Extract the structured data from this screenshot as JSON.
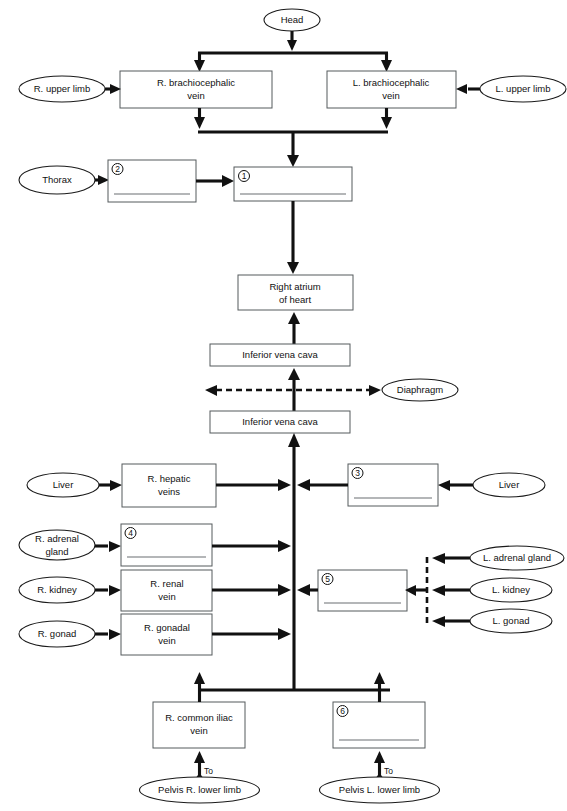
{
  "diagram": {
    "boxes": {
      "r_brachiocephalic": "R. brachiocephalic\nvein",
      "r_brachiocephalic_l1": "R. brachiocephalic",
      "r_brachiocephalic_l2": "vein",
      "l_brachiocephalic_l1": "L. brachiocephalic",
      "l_brachiocephalic_l2": "vein",
      "blank_2": "",
      "blank_1": "",
      "right_atrium_l1": "Right atrium",
      "right_atrium_l2": "of heart",
      "ivc_upper": "Inferior vena cava",
      "ivc_lower": "Inferior vena cava",
      "r_hepatic_l1": "R. hepatic",
      "r_hepatic_l2": "veins",
      "blank_3": "",
      "blank_4": "",
      "r_renal_l1": "R. renal",
      "r_renal_l2": "vein",
      "blank_5": "",
      "r_gonadal_l1": "R. gonadal",
      "r_gonadal_l2": "vein",
      "r_common_iliac_l1": "R. common iliac",
      "r_common_iliac_l2": "vein",
      "blank_6": ""
    },
    "blank_numbers": {
      "one": "1",
      "two": "2",
      "three": "3",
      "four": "4",
      "five": "5",
      "six": "6"
    },
    "ellipses": {
      "head": "Head",
      "r_upper_limb": "R. upper limb",
      "l_upper_limb": "L. upper limb",
      "thorax": "Thorax",
      "diaphragm": "Diaphragm",
      "liver_right": "Liver",
      "liver_left": "Liver",
      "r_adrenal_gland_l1": "R. adrenal",
      "r_adrenal_gland_l2": "gland",
      "r_kidney": "R. kidney",
      "r_gonad": "R. gonad",
      "l_adrenal_gland": "L. adrenal gland",
      "l_kidney": "L. kidney",
      "l_gonad": "L. gonad",
      "pelvis_r_lower_limb": "Pelvis  R. lower limb",
      "pelvis_l_lower_limb": "Pelvis  L. lower limb"
    },
    "arrow_labels": {
      "to_right": "To",
      "to_left": "To"
    },
    "colors": {
      "stroke": "#111111",
      "box_stroke": "#555a5c",
      "background": "#ffffff"
    }
  }
}
